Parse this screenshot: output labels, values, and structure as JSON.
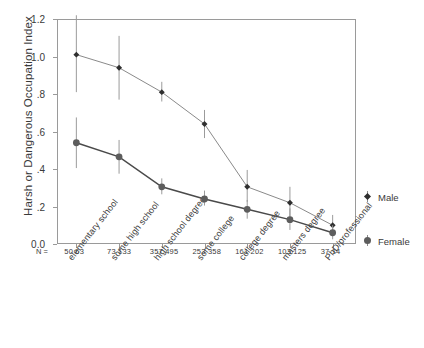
{
  "chart_data": {
    "type": "line",
    "title": "",
    "xlabel": "",
    "ylabel": "Harsh or Dangerous Occupation Index",
    "ylim": [
      0.0,
      1.2
    ],
    "ytick_labels": [
      "1.2",
      "1.0",
      ".8",
      ".6",
      ".4",
      ".2",
      "0.0"
    ],
    "ytick_values": [
      1.2,
      1.0,
      0.8,
      0.6,
      0.4,
      0.2,
      0.0
    ],
    "grid": false,
    "legend_position": "right",
    "categories": [
      "elementary school",
      "some high school",
      "high school degree",
      "some college",
      "college degree",
      "masters degree",
      "PhD/professional"
    ],
    "n_label": "N =",
    "n_values": [
      {
        "male": "50",
        "female": "63"
      },
      {
        "male": "73",
        "female": "133"
      },
      {
        "male": "357",
        "female": "495"
      },
      {
        "male": "253",
        "female": "358"
      },
      {
        "male": "161",
        "female": "202"
      },
      {
        "male": "103",
        "female": "125"
      },
      {
        "male": "37",
        "female": "14"
      }
    ],
    "series": [
      {
        "name": "Male",
        "marker": "diamond",
        "color": "#2f2f2f",
        "line_color": "#8a8a8a",
        "values": [
          1.01,
          0.94,
          0.81,
          0.64,
          0.305,
          0.22,
          0.1
        ],
        "err_low": [
          0.81,
          0.77,
          0.76,
          0.565,
          0.225,
          0.145,
          0.055
        ],
        "err_high": [
          1.22,
          1.11,
          0.865,
          0.715,
          0.395,
          0.305,
          0.155
        ]
      },
      {
        "name": "Female",
        "marker": "circle",
        "color": "#5d5d5d",
        "line_color": "#4a4a4a",
        "values": [
          0.54,
          0.465,
          0.305,
          0.24,
          0.185,
          0.13,
          0.06
        ],
        "err_low": [
          0.405,
          0.375,
          0.265,
          0.205,
          0.135,
          0.075,
          0.025
        ],
        "err_high": [
          0.675,
          0.555,
          0.35,
          0.285,
          0.235,
          0.19,
          0.1
        ]
      }
    ]
  },
  "legend": {
    "items": [
      {
        "label": "Male"
      },
      {
        "label": "Female"
      }
    ]
  }
}
